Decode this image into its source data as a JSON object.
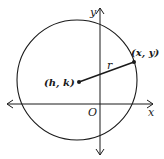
{
  "diagram": {
    "title": "",
    "type": "circle-on-coordinate-plane",
    "axes": {
      "x_label": "x",
      "y_label": "y",
      "origin_label": "O"
    },
    "circle": {
      "center_label": "(h, k)",
      "point_label": "(x, y)",
      "radius_label": "r"
    },
    "colors": {
      "stroke": "#1a1a1a",
      "background": "#ffffff"
    }
  }
}
